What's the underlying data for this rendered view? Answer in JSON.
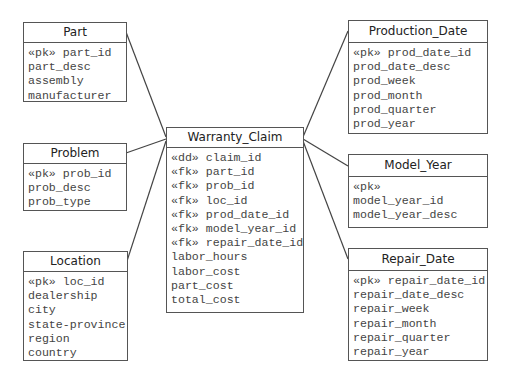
{
  "diagram": {
    "type": "star-schema",
    "fact": {
      "name": "Warranty_Claim",
      "attributes": [
        "«dd» claim_id",
        "«fk» part_id",
        "«fk» prob_id",
        "«fk» loc_id",
        "«fk» prod_date_id",
        "«fk» model_year_id",
        "«fk» repair_date_id",
        "labor_hours",
        "labor_cost",
        "part_cost",
        "total_cost"
      ]
    },
    "dimensions": {
      "part": {
        "name": "Part",
        "attributes": [
          "«pk» part_id",
          "part_desc",
          "assembly",
          "manufacturer"
        ]
      },
      "problem": {
        "name": "Problem",
        "attributes": [
          "«pk» prob_id",
          "prob_desc",
          "prob_type"
        ]
      },
      "location": {
        "name": "Location",
        "attributes": [
          "«pk» loc_id",
          "dealership",
          "city",
          "state-province",
          "region",
          "country"
        ]
      },
      "production_date": {
        "name": "Production_Date",
        "attributes": [
          "«pk» prod_date_id",
          "prod_date_desc",
          "prod_week",
          "prod_month",
          "prod_quarter",
          "prod_year"
        ]
      },
      "model_year": {
        "name": "Model_Year",
        "attributes": [
          "«pk»",
          "model_year_id",
          "model_year_desc"
        ]
      },
      "repair_date": {
        "name": "Repair_Date",
        "attributes": [
          "«pk» repair_date_id",
          "repair_date_desc",
          "repair_week",
          "repair_month",
          "repair_quarter",
          "repair_year"
        ]
      }
    },
    "relationships": [
      {
        "from": "Part",
        "to": "Warranty_Claim"
      },
      {
        "from": "Problem",
        "to": "Warranty_Claim"
      },
      {
        "from": "Location",
        "to": "Warranty_Claim"
      },
      {
        "from": "Production_Date",
        "to": "Warranty_Claim"
      },
      {
        "from": "Model_Year",
        "to": "Warranty_Claim"
      },
      {
        "from": "Repair_Date",
        "to": "Warranty_Claim"
      }
    ],
    "colors": {
      "border": "#555555",
      "line": "#444444",
      "title_text": "#222222",
      "attr_text": "#444444",
      "background": "#ffffff"
    }
  }
}
